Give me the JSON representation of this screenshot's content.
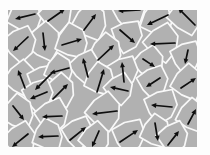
{
  "figure": {
    "canvas": {
      "width": 210,
      "height": 155
    },
    "region": {
      "x": 8,
      "y": 10,
      "width": 189,
      "height": 137
    },
    "colors": {
      "page_background": "#fdfdfd",
      "grain_fill": "#b1b1b1",
      "boundary": "#f8f8f8",
      "arrow": "#0e0e0e"
    },
    "style": {
      "boundary_width": 1.7,
      "arrow_width": 1.7,
      "arrowhead_length": 5.2,
      "arrowhead_halfwidth": 2.4,
      "radius_pattern": [
        1.0,
        1.28,
        0.9,
        1.22,
        0.95,
        1.33,
        1.08
      ]
    },
    "domains": [
      {
        "cx": 25,
        "cy": 16,
        "r": 16,
        "rot": 8
      },
      {
        "cx": 56,
        "cy": 15,
        "r": 15,
        "rot": 30
      },
      {
        "cx": 90,
        "cy": 22,
        "r": 16,
        "rot": 14
      },
      {
        "cx": 129,
        "cy": 12,
        "r": 15,
        "rot": 40
      },
      {
        "cx": 157,
        "cy": 20,
        "r": 15,
        "rot": 5
      },
      {
        "cx": 186,
        "cy": 16,
        "r": 16,
        "rot": 22
      },
      {
        "cx": 127,
        "cy": 36,
        "r": 14,
        "rot": 50
      },
      {
        "cx": 44,
        "cy": 42,
        "r": 16,
        "rot": 18
      },
      {
        "cx": 20,
        "cy": 44,
        "r": 15,
        "rot": 36
      },
      {
        "cx": 72,
        "cy": 42,
        "r": 15,
        "rot": 4
      },
      {
        "cx": 162,
        "cy": 43,
        "r": 16,
        "rot": 28
      },
      {
        "cx": 186,
        "cy": 57,
        "r": 14,
        "rot": 45
      },
      {
        "cx": 106,
        "cy": 52,
        "r": 15,
        "rot": 12
      },
      {
        "cx": 85,
        "cy": 67,
        "r": 14,
        "rot": 33
      },
      {
        "cx": 21,
        "cy": 79,
        "r": 15,
        "rot": 20
      },
      {
        "cx": 44,
        "cy": 81,
        "r": 15,
        "rot": 48
      },
      {
        "cx": 59,
        "cy": 70,
        "r": 13,
        "rot": 8
      },
      {
        "cx": 149,
        "cy": 63,
        "r": 14,
        "rot": 26
      },
      {
        "cx": 153,
        "cy": 82,
        "r": 14,
        "rot": 39
      },
      {
        "cx": 188,
        "cy": 83,
        "r": 15,
        "rot": 15
      },
      {
        "cx": 123,
        "cy": 72,
        "r": 14,
        "rot": 44
      },
      {
        "cx": 100,
        "cy": 80,
        "r": 14,
        "rot": 6
      },
      {
        "cx": 119,
        "cy": 89,
        "r": 13,
        "rot": 31
      },
      {
        "cx": 60,
        "cy": 91,
        "r": 14,
        "rot": 17
      },
      {
        "cx": 38,
        "cy": 95,
        "r": 14,
        "rot": 42
      },
      {
        "cx": 18,
        "cy": 113,
        "r": 15,
        "rot": 10
      },
      {
        "cx": 52,
        "cy": 116,
        "r": 15,
        "rot": 35
      },
      {
        "cx": 104,
        "cy": 112,
        "r": 16,
        "rot": 24
      },
      {
        "cx": 161,
        "cy": 106,
        "r": 15,
        "rot": 47
      },
      {
        "cx": 192,
        "cy": 116,
        "r": 14,
        "rot": 13
      },
      {
        "cx": 20,
        "cy": 140,
        "r": 15,
        "rot": 29
      },
      {
        "cx": 48,
        "cy": 136,
        "r": 14,
        "rot": 3
      },
      {
        "cx": 78,
        "cy": 133,
        "r": 14,
        "rot": 38
      },
      {
        "cx": 95,
        "cy": 139,
        "r": 14,
        "rot": 21
      },
      {
        "cx": 129,
        "cy": 136,
        "r": 15,
        "rot": 46
      },
      {
        "cx": 156,
        "cy": 132,
        "r": 14,
        "rot": 9
      },
      {
        "cx": 173,
        "cy": 138,
        "r": 14,
        "rot": 34
      }
    ],
    "arrows": [
      {
        "x1": 35,
        "y1": 14,
        "x2": 15,
        "y2": 19
      },
      {
        "x1": 48,
        "y1": 21,
        "x2": 65,
        "y2": 9
      },
      {
        "x1": 84,
        "y1": 30,
        "x2": 96,
        "y2": 14
      },
      {
        "x1": 140,
        "y1": 10,
        "x2": 118,
        "y2": 11
      },
      {
        "x1": 168,
        "y1": 15,
        "x2": 147,
        "y2": 25
      },
      {
        "x1": 195,
        "y1": 25,
        "x2": 178,
        "y2": 8
      },
      {
        "x1": 120,
        "y1": 30,
        "x2": 135,
        "y2": 43
      },
      {
        "x1": 43,
        "y1": 33,
        "x2": 45,
        "y2": 51
      },
      {
        "x1": 28,
        "y1": 37,
        "x2": 13,
        "y2": 51
      },
      {
        "x1": 62,
        "y1": 45,
        "x2": 82,
        "y2": 39
      },
      {
        "x1": 175,
        "y1": 43,
        "x2": 150,
        "y2": 44
      },
      {
        "x1": 188,
        "y1": 50,
        "x2": 185,
        "y2": 64
      },
      {
        "x1": 98,
        "y1": 60,
        "x2": 114,
        "y2": 45
      },
      {
        "x1": 88,
        "y1": 77,
        "x2": 83,
        "y2": 58
      },
      {
        "x1": 25,
        "y1": 88,
        "x2": 18,
        "y2": 70
      },
      {
        "x1": 53,
        "y1": 72,
        "x2": 35,
        "y2": 90
      },
      {
        "x1": 69,
        "y1": 68,
        "x2": 50,
        "y2": 73
      },
      {
        "x1": 143,
        "y1": 59,
        "x2": 155,
        "y2": 67
      },
      {
        "x1": 160,
        "y1": 78,
        "x2": 146,
        "y2": 87
      },
      {
        "x1": 181,
        "y1": 88,
        "x2": 196,
        "y2": 78
      },
      {
        "x1": 124,
        "y1": 82,
        "x2": 122,
        "y2": 62
      },
      {
        "x1": 97,
        "y1": 92,
        "x2": 104,
        "y2": 69
      },
      {
        "x1": 128,
        "y1": 91,
        "x2": 110,
        "y2": 87
      },
      {
        "x1": 53,
        "y1": 99,
        "x2": 68,
        "y2": 84
      },
      {
        "x1": 47,
        "y1": 92,
        "x2": 30,
        "y2": 99
      },
      {
        "x1": 13,
        "y1": 106,
        "x2": 24,
        "y2": 120
      },
      {
        "x1": 62,
        "y1": 116,
        "x2": 42,
        "y2": 117
      },
      {
        "x1": 117,
        "y1": 111,
        "x2": 92,
        "y2": 114
      },
      {
        "x1": 172,
        "y1": 107,
        "x2": 151,
        "y2": 105
      },
      {
        "x1": 188,
        "y1": 124,
        "x2": 196,
        "y2": 109
      },
      {
        "x1": 28,
        "y1": 134,
        "x2": 12,
        "y2": 147
      },
      {
        "x1": 58,
        "y1": 136,
        "x2": 38,
        "y2": 137
      },
      {
        "x1": 70,
        "y1": 140,
        "x2": 86,
        "y2": 127
      },
      {
        "x1": 99,
        "y1": 131,
        "x2": 92,
        "y2": 147
      },
      {
        "x1": 120,
        "y1": 142,
        "x2": 138,
        "y2": 130
      },
      {
        "x1": 155,
        "y1": 123,
        "x2": 158,
        "y2": 141
      },
      {
        "x1": 168,
        "y1": 145,
        "x2": 179,
        "y2": 131
      }
    ]
  }
}
